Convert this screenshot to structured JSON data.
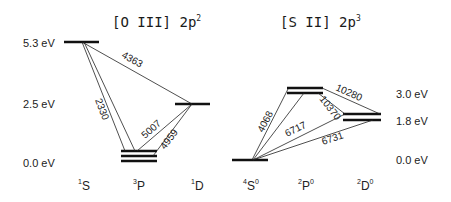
{
  "diagram": {
    "panels": [
      {
        "ion": "[O III]",
        "config_base": "2p",
        "config_exp": "2",
        "energy_labels": [
          "5.3 eV",
          "2.5 eV",
          "0.0 eV"
        ],
        "terms": [
          {
            "name": "S",
            "mult": "1",
            "parity": ""
          },
          {
            "name": "P",
            "mult": "3",
            "parity": ""
          },
          {
            "name": "D",
            "mult": "1",
            "parity": ""
          }
        ],
        "transitions": [
          {
            "label": "4363",
            "from": "1S",
            "to": "1D"
          },
          {
            "label": "2330",
            "from": "1S",
            "to": "3P"
          },
          {
            "label": "5007",
            "from": "1D",
            "to": "3P"
          },
          {
            "label": "4959",
            "from": "1D",
            "to": "3P"
          }
        ]
      },
      {
        "ion": "[S II]",
        "config_base": "2p",
        "config_exp": "3",
        "energy_labels": [
          "3.0 eV",
          "1.8 eV",
          "0.0 eV"
        ],
        "terms": [
          {
            "name": "S",
            "mult": "4",
            "parity": "0"
          },
          {
            "name": "P",
            "mult": "2",
            "parity": "0"
          },
          {
            "name": "D",
            "mult": "2",
            "parity": "0"
          }
        ],
        "transitions": [
          {
            "label": "4068",
            "from": "2P0",
            "to": "4S0"
          },
          {
            "label": "6717",
            "from": "2D0",
            "to": "4S0"
          },
          {
            "label": "6731",
            "from": "2D0",
            "to": "4S0"
          },
          {
            "label": "10280",
            "from": "2P0",
            "to": "2D0"
          },
          {
            "label": "10370",
            "from": "2P0",
            "to": "2D0"
          }
        ]
      }
    ]
  }
}
